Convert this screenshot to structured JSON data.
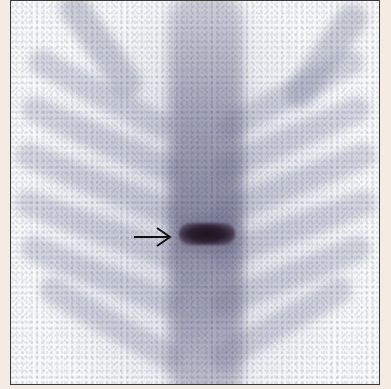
{
  "figure": {
    "type": "bone-scintigraphy",
    "view": "posterior thoracic spine",
    "annotation": {
      "icon": "arrow-right-icon",
      "points_to": "focal uptake hot spot"
    },
    "colors": {
      "background": "#f5ebe2",
      "frame_border": "#3a3a3a",
      "image_bg": "#f7f8fa",
      "uptake_soft": "#9a9ab4",
      "uptake_hot": "#1b1420"
    }
  }
}
